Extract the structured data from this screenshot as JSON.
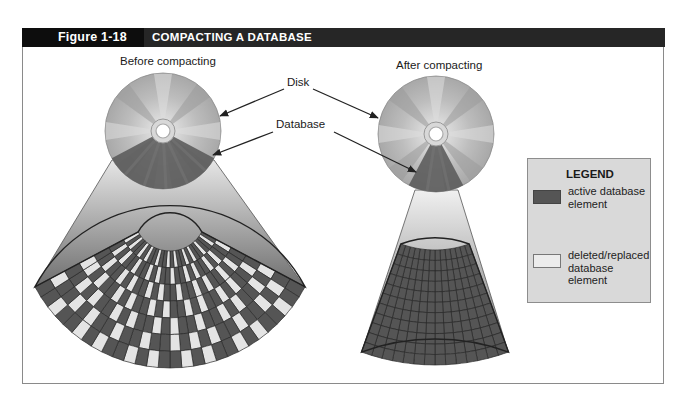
{
  "header": {
    "figure_number": "Figure 1-18",
    "title": "COMPACTING A DATABASE"
  },
  "panels": {
    "before": {
      "label": "Before compacting",
      "disk": {
        "cx": 163,
        "cy": 131,
        "r": 58,
        "db_sector_deg": [
          28,
          152
        ]
      },
      "fan": {
        "cx": 170,
        "cy": 215,
        "r_inner": 36,
        "r_outer": 153,
        "half_angle_deg": 62,
        "rings": 7,
        "spokes": 28
      },
      "beam": {
        "top_left": [
          112,
          160
        ],
        "top_right": [
          214,
          160
        ],
        "bottom_left": [
          35,
          287
        ],
        "bottom_right": [
          305,
          287
        ]
      }
    },
    "after": {
      "label": "After compacting",
      "disk": {
        "cx": 436,
        "cy": 134,
        "r": 58,
        "db_sector_deg": [
          62,
          118
        ]
      },
      "fan": {
        "cx": 435,
        "cy": 150,
        "r_inner": 100,
        "r_outer": 215,
        "half_angle_deg": 20,
        "rings": 11,
        "spokes": 14
      },
      "beam": {
        "top_left": [
          415,
          190
        ],
        "top_right": [
          458,
          190
        ],
        "bottom_left": [
          362,
          351
        ],
        "bottom_right": [
          508,
          351
        ]
      }
    }
  },
  "callouts": {
    "disk": {
      "label": "Disk",
      "label_pos": [
        287,
        84
      ],
      "arrows": [
        [
          284,
          89,
          220,
          116
        ],
        [
          313,
          89,
          378,
          118
        ]
      ]
    },
    "database": {
      "label": "Database",
      "label_pos": [
        276,
        126
      ],
      "arrows": [
        [
          273,
          132,
          213,
          155
        ],
        [
          334,
          132,
          416,
          172
        ]
      ]
    }
  },
  "legend": {
    "title": "LEGEND",
    "items": [
      {
        "label": "active database element",
        "color": "#555555"
      },
      {
        "label": "deleted/replaced database element",
        "color": "#ececec"
      }
    ]
  },
  "colors": {
    "active": "#555555",
    "deleted": "#e4e4e4",
    "grid_line": "#2a2a2a",
    "disk_light": "#c8c8c8",
    "disk_sector": "#5a5a5a",
    "header_bg": "#262626"
  },
  "deleted_pattern": "0100100101001010010010100101|1001010010100100101001001010|0010100101001001010010100100|0100101001010010100101001011|1010010100100101001010010100|0101001001010100100100101001|0010010100101001010010100100"
}
